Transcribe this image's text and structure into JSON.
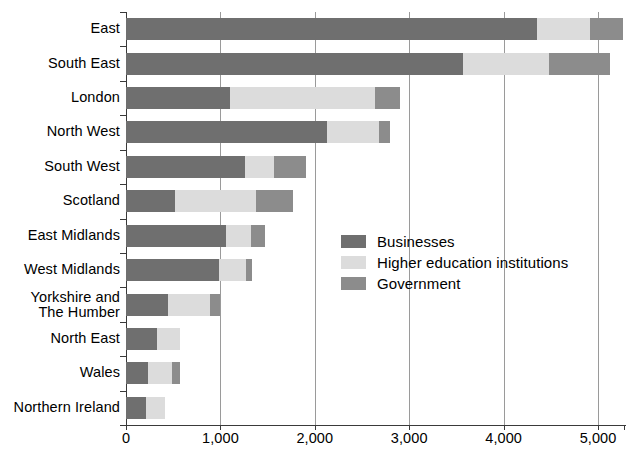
{
  "chart_data": {
    "type": "bar",
    "orientation": "horizontal",
    "stacked": true,
    "title": "",
    "xlabel": "",
    "ylabel": "",
    "xlim": [
      0,
      5275
    ],
    "grid": "vertical",
    "legend_position": "inside-center-right",
    "xticks": [
      0,
      1000,
      2000,
      3000,
      4000,
      5000
    ],
    "xtick_labels": [
      "0",
      "1,000",
      "2,000",
      "3,000",
      "4,000",
      "5,000"
    ],
    "categories": [
      "East",
      "South East",
      "London",
      "North West",
      "South West",
      "Scotland",
      "East Midlands",
      "West Midlands",
      "Yorkshire and\nThe Humber",
      "North East",
      "Wales",
      "Northern Ireland"
    ],
    "series": [
      {
        "name": "Businesses",
        "color": "#6f6f6f",
        "values": [
          4355,
          3570,
          1100,
          2130,
          1265,
          520,
          1060,
          980,
          440,
          330,
          230,
          210
        ]
      },
      {
        "name": "Higher education institutions",
        "color": "#dcdcdc",
        "values": [
          560,
          910,
          1540,
          550,
          305,
          860,
          265,
          290,
          450,
          240,
          260,
          200
        ]
      },
      {
        "name": "Government",
        "color": "#8c8c8c",
        "values": [
          345,
          645,
          265,
          120,
          340,
          390,
          145,
          70,
          110,
          0,
          80,
          0
        ]
      }
    ]
  },
  "legend": {
    "items": [
      {
        "label": "Businesses",
        "color": "#6f6f6f"
      },
      {
        "label": "Higher education institutions",
        "color": "#dcdcdc"
      },
      {
        "label": "Government",
        "color": "#8c8c8c"
      }
    ]
  },
  "colors": {
    "businesses": "#6f6f6f",
    "higher_education": "#dcdcdc",
    "government": "#8c8c8c",
    "axis": "#3a3a3a",
    "grid": "#9a9a9a",
    "background": "#ffffff",
    "text": "#000000"
  }
}
